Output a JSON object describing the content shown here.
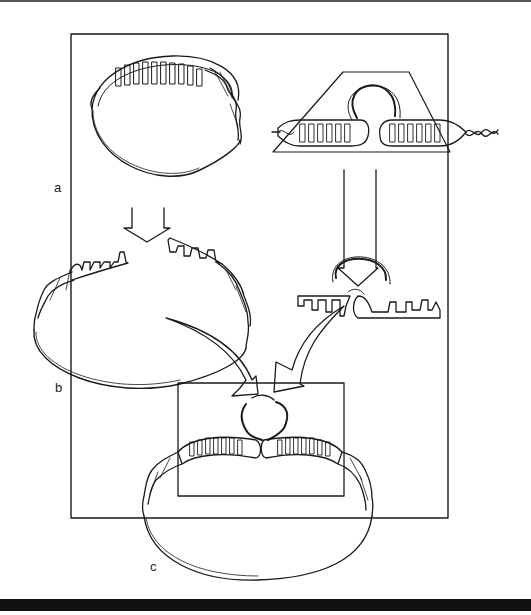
{
  "figure": {
    "panel_labels": {
      "a": "a",
      "b": "b",
      "c": "c"
    },
    "colors": {
      "ink": "#1a1a1a",
      "background": "#ffffff",
      "bottom_bar": "#111111"
    },
    "panels": [
      {
        "id": "a",
        "description": "circular DNA with paired helical region (left) and hairpin-bearing duplex inside trapezoid (right)"
      },
      {
        "id": "b",
        "description": "opened circular DNA with single-stranded comb ends (left) and hairpin with separated single-stranded tails (right)"
      },
      {
        "id": "c",
        "description": "recombined circular DNA with joined hairpin inside rectangular frame"
      }
    ],
    "base_letters_top_left": [
      "A",
      "A",
      "B",
      "C",
      "T",
      "T"
    ],
    "arrows": [
      {
        "from": "a-left",
        "to": "b-left",
        "style": "open-block-down"
      },
      {
        "from": "a-right",
        "to": "b-right",
        "style": "open-block-down"
      },
      {
        "from": "b-left",
        "to": "c",
        "style": "curved-open"
      },
      {
        "from": "b-right",
        "to": "c",
        "style": "curved-open"
      }
    ]
  }
}
